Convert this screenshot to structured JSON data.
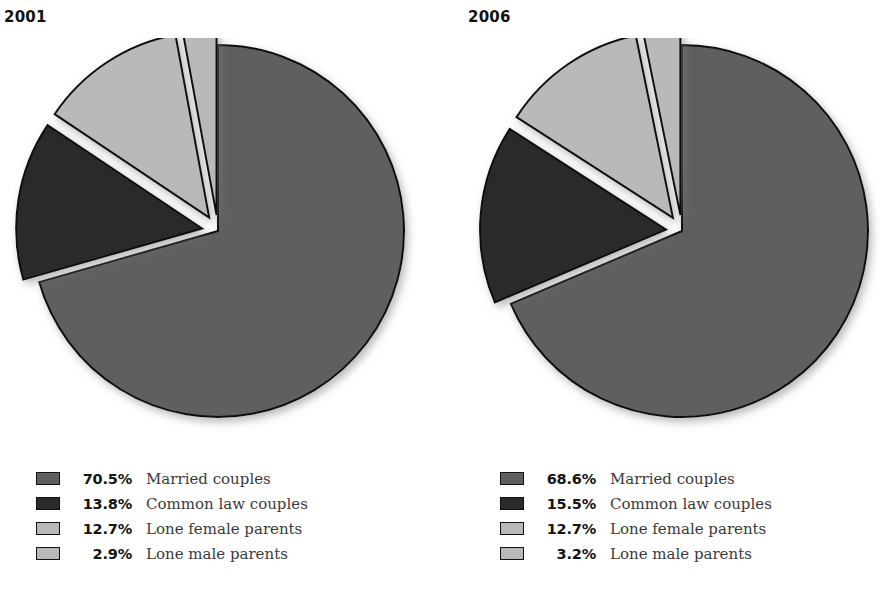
{
  "chart_data": [
    {
      "type": "pie",
      "title": "2001",
      "categories": [
        "Married couples",
        "Common law couples",
        "Lone female parents",
        "Lone male parents"
      ],
      "values": [
        70.5,
        13.8,
        12.7,
        2.9
      ],
      "value_labels": [
        "70.5%",
        "13.8%",
        "12.7%",
        "2.9%"
      ],
      "colors": [
        "#5e5e5e",
        "#2a2a2a",
        "#b9b9b9",
        "#b9b9b9"
      ],
      "exploded": [
        false,
        true,
        true,
        true
      ],
      "legend_position": "bottom",
      "grid": false,
      "xlabel": "",
      "ylabel": ""
    },
    {
      "type": "pie",
      "title": "2006",
      "categories": [
        "Married couples",
        "Common law couples",
        "Lone female parents",
        "Lone male parents"
      ],
      "values": [
        68.6,
        15.5,
        12.7,
        3.2
      ],
      "value_labels": [
        "68.6%",
        "15.5%",
        "12.7%",
        "3.2%"
      ],
      "colors": [
        "#5e5e5e",
        "#2a2a2a",
        "#b9b9b9",
        "#b9b9b9"
      ],
      "exploded": [
        false,
        true,
        true,
        true
      ],
      "legend_position": "bottom",
      "grid": false,
      "xlabel": "",
      "ylabel": ""
    }
  ],
  "panels": [
    {
      "year": "2001",
      "legend": [
        {
          "pct": "70.5%",
          "label": "Married couples",
          "color": "#5e5e5e"
        },
        {
          "pct": "13.8%",
          "label": "Common law couples",
          "color": "#2a2a2a"
        },
        {
          "pct": "12.7%",
          "label": "Lone female parents",
          "color": "#b9b9b9"
        },
        {
          "pct": "2.9%",
          "label": "Lone male parents",
          "color": "#b9b9b9"
        }
      ]
    },
    {
      "year": "2006",
      "legend": [
        {
          "pct": "68.6%",
          "label": "Married couples",
          "color": "#5e5e5e"
        },
        {
          "pct": "15.5%",
          "label": "Common law couples",
          "color": "#2a2a2a"
        },
        {
          "pct": "12.7%",
          "label": "Lone female parents",
          "color": "#b9b9b9"
        },
        {
          "pct": "3.2%",
          "label": "Lone male parents",
          "color": "#b9b9b9"
        }
      ]
    }
  ],
  "style": {
    "background": "#ffffff",
    "outline": "#111111",
    "title_color": "#111111",
    "label_color": "#3a3a3a"
  }
}
